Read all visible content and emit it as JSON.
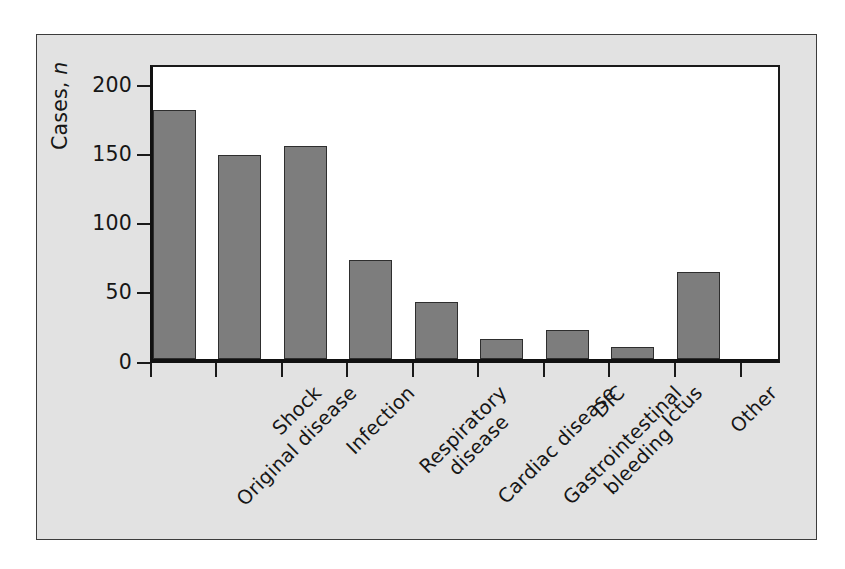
{
  "figure": {
    "background_color": "#e2e2e2",
    "plot_background_color": "#ffffff",
    "bar_fill_color": "#7d7d7d",
    "bar_edge_color": "#2e2e2e",
    "axis_color": "#111111"
  },
  "chart_data": {
    "type": "bar",
    "title": "",
    "xlabel": "",
    "ylabel": "Cases, n",
    "ylabel_plain": "Cases,",
    "ylabel_italic": "n",
    "ylim": [
      0,
      215
    ],
    "yticks": [
      0,
      50,
      100,
      150,
      200
    ],
    "ytick_labels": [
      "0",
      "50",
      "100",
      "150",
      "200"
    ],
    "grid": false,
    "legend": false,
    "categories": [
      "Original disease",
      "Shock",
      "Infection",
      "Respiratory disease",
      "Cardiac disease",
      "Gastrointestinal bleeding",
      "DIC",
      "Ictus",
      "Other"
    ],
    "category_lines": [
      [
        "Original disease"
      ],
      [
        "Shock"
      ],
      [
        "Infection"
      ],
      [
        "Respiratory",
        "disease"
      ],
      [
        "Cardiac disease"
      ],
      [
        "Gastrointestinal",
        "bleeding"
      ],
      [
        "DIC"
      ],
      [
        "Ictus"
      ],
      [
        "Other"
      ]
    ],
    "values": [
      183,
      150,
      157,
      73,
      42,
      15,
      21,
      9,
      64
    ]
  }
}
